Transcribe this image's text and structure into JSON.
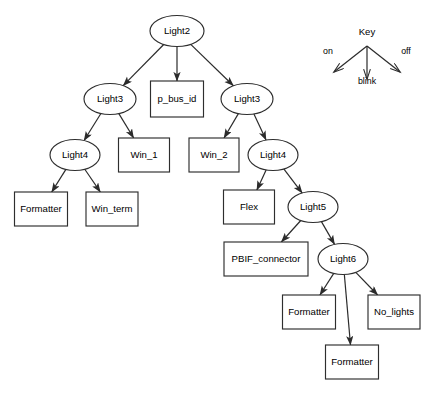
{
  "diagram": {
    "background_color": "#ffffff",
    "line_color": "#2b2b2b",
    "text_color": "#000000",
    "node_fill": "#ffffff"
  },
  "key": {
    "title": "Key",
    "on_label": "on",
    "off_label": "off",
    "blink_label": "blink",
    "x": 367,
    "y": 32
  },
  "nodes": [
    {
      "id": "light2",
      "label": "Light2",
      "shape": "ellipse",
      "cx": 177,
      "cy": 31,
      "rw": 27,
      "rh": 15.5
    },
    {
      "id": "light3_l",
      "label": "Light3",
      "shape": "ellipse",
      "cx": 110,
      "cy": 99,
      "rw": 26,
      "rh": 15.5
    },
    {
      "id": "p_bus_id",
      "label": "p_bus_id",
      "shape": "rect",
      "cx": 177,
      "cy": 99,
      "rw": 26.5,
      "rh": 18
    },
    {
      "id": "light3_r",
      "label": "Light3",
      "shape": "ellipse",
      "cx": 247,
      "cy": 99,
      "rw": 26,
      "rh": 15.5
    },
    {
      "id": "light4_l",
      "label": "Light4",
      "shape": "ellipse",
      "cx": 75,
      "cy": 155,
      "rw": 25,
      "rh": 15.5
    },
    {
      "id": "win_1",
      "label": "Win_1",
      "shape": "rect",
      "cx": 144,
      "cy": 155,
      "rw": 25.5,
      "rh": 17
    },
    {
      "id": "win_2",
      "label": "Win_2",
      "shape": "rect",
      "cx": 214,
      "cy": 155,
      "rw": 25,
      "rh": 17
    },
    {
      "id": "light4_r",
      "label": "Light4",
      "shape": "ellipse",
      "cx": 273,
      "cy": 155,
      "rw": 25,
      "rh": 15.5
    },
    {
      "id": "formatter_1",
      "label": "Formatter",
      "shape": "rect",
      "cx": 41,
      "cy": 209,
      "rw": 26.5,
      "rh": 17
    },
    {
      "id": "win_term",
      "label": "Win_term",
      "shape": "rect",
      "cx": 112,
      "cy": 209,
      "rw": 26,
      "rh": 17
    },
    {
      "id": "flex",
      "label": "Flex",
      "shape": "rect",
      "cx": 249,
      "cy": 207,
      "rw": 25.5,
      "rh": 17
    },
    {
      "id": "light5",
      "label": "Light5",
      "shape": "ellipse",
      "cx": 313,
      "cy": 207,
      "rw": 25,
      "rh": 15.5
    },
    {
      "id": "pbif",
      "label": "PBIF_connector",
      "shape": "rect",
      "cx": 266,
      "cy": 259,
      "rw": 42,
      "rh": 17
    },
    {
      "id": "light6",
      "label": "Light6",
      "shape": "ellipse",
      "cx": 343,
      "cy": 259,
      "rw": 25,
      "rh": 15.5
    },
    {
      "id": "formatter_2",
      "label": "Formatter",
      "shape": "rect",
      "cx": 309,
      "cy": 312,
      "rw": 26.5,
      "rh": 17
    },
    {
      "id": "no_lights",
      "label": "No_lights",
      "shape": "rect",
      "cx": 394,
      "cy": 312,
      "rw": 26,
      "rh": 17
    },
    {
      "id": "formatter_3",
      "label": "Formatter",
      "shape": "rect",
      "cx": 352,
      "cy": 362,
      "rw": 26.5,
      "rh": 17
    }
  ],
  "edges": [
    {
      "from": "light2",
      "to": "light3_l",
      "transition": "on"
    },
    {
      "from": "light2",
      "to": "p_bus_id",
      "transition": "blink"
    },
    {
      "from": "light2",
      "to": "light3_r",
      "transition": "off"
    },
    {
      "from": "light3_l",
      "to": "light4_l",
      "transition": "on"
    },
    {
      "from": "light3_l",
      "to": "win_1",
      "transition": "off"
    },
    {
      "from": "light3_r",
      "to": "win_2",
      "transition": "on"
    },
    {
      "from": "light3_r",
      "to": "light4_r",
      "transition": "off"
    },
    {
      "from": "light4_l",
      "to": "formatter_1",
      "transition": "on"
    },
    {
      "from": "light4_l",
      "to": "win_term",
      "transition": "off"
    },
    {
      "from": "light4_r",
      "to": "flex",
      "transition": "on"
    },
    {
      "from": "light4_r",
      "to": "light5",
      "transition": "off"
    },
    {
      "from": "light5",
      "to": "pbif",
      "transition": "on"
    },
    {
      "from": "light5",
      "to": "light6",
      "transition": "off"
    },
    {
      "from": "light6",
      "to": "formatter_2",
      "transition": "on"
    },
    {
      "from": "light6",
      "to": "formatter_3",
      "transition": "blink"
    },
    {
      "from": "light6",
      "to": "no_lights",
      "transition": "off"
    }
  ]
}
